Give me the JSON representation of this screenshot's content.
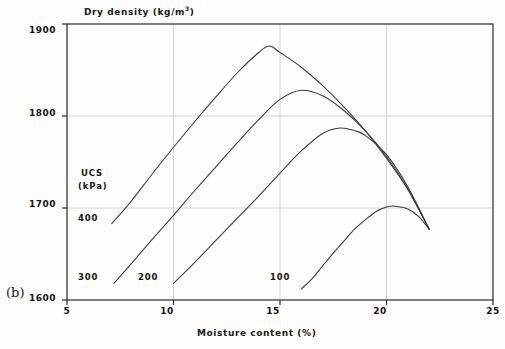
{
  "panel": {
    "label": "(b)"
  },
  "axes": {
    "x": {
      "title": "Moisture content (%)",
      "ticks": [
        5,
        10,
        15,
        20,
        25
      ],
      "min": 5,
      "max": 25
    },
    "y": {
      "title": "Dry density (kg/m",
      "title_sup": "3",
      "title_suffix": ")",
      "title_full": "Dry density (kg/m3)",
      "ticks": [
        1600,
        1700,
        1800,
        1900
      ],
      "min": 1600,
      "max": 1900
    }
  },
  "legend": {
    "line1": "UCS",
    "line2": "(kPa)"
  },
  "curve_labels": {
    "c400": "400",
    "c300": "300",
    "c200": "200",
    "c100": "100"
  },
  "colors": {
    "line": "#3a3a3a",
    "grid": "#c9c9c9",
    "frame": "#2a2a2a",
    "text": "#141414",
    "background": "#fdfdfc"
  },
  "chart_data": {
    "type": "line",
    "title": "",
    "xlabel": "Moisture content (%)",
    "ylabel": "Dry density (kg/m3)",
    "xlim": [
      5,
      25
    ],
    "ylim": [
      1600,
      1900
    ],
    "xticks": [
      5,
      10,
      15,
      20,
      25
    ],
    "yticks": [
      1600,
      1700,
      1800,
      1900
    ],
    "grid": true,
    "legend_position": "inline-labels-left",
    "legend_title": "UCS (kPa)",
    "series": [
      {
        "name": "400",
        "label": "400",
        "peak": {
          "x": 14.5,
          "y": 1876
        },
        "x": [
          7.1,
          8.0,
          9.0,
          10.0,
          11.0,
          12.0,
          13.0,
          14.0,
          14.5,
          15.0,
          16.0,
          17.0,
          18.0,
          19.0,
          20.0,
          21.0,
          22.0
        ],
        "y": [
          1683,
          1707,
          1737,
          1766,
          1794,
          1821,
          1847,
          1869,
          1876,
          1869,
          1853,
          1833,
          1810,
          1784,
          1754,
          1720,
          1677
        ]
      },
      {
        "name": "300",
        "label": "300",
        "peak": {
          "x": 16.0,
          "y": 1828
        },
        "x": [
          7.2,
          8.0,
          9.0,
          10.0,
          11.0,
          12.0,
          13.0,
          14.0,
          15.0,
          16.0,
          17.0,
          18.0,
          19.0,
          20.0,
          21.0,
          22.0
        ],
        "y": [
          1618,
          1639,
          1666,
          1692,
          1719,
          1745,
          1771,
          1796,
          1818,
          1828,
          1822,
          1806,
          1784,
          1756,
          1721,
          1677
        ]
      },
      {
        "name": "200",
        "label": "200",
        "peak": {
          "x": 17.8,
          "y": 1787
        },
        "x": [
          10.0,
          11.0,
          12.0,
          13.0,
          14.0,
          15.0,
          16.0,
          17.0,
          17.8,
          18.5,
          19.0,
          20.0,
          21.0,
          22.0
        ],
        "y": [
          1618,
          1641,
          1665,
          1689,
          1713,
          1738,
          1762,
          1781,
          1787,
          1784,
          1779,
          1758,
          1723,
          1677
        ]
      },
      {
        "name": "100",
        "label": "100",
        "peak": {
          "x": 20.4,
          "y": 1702
        },
        "x": [
          16.0,
          16.5,
          17.0,
          17.5,
          18.0,
          18.5,
          19.0,
          19.5,
          20.0,
          20.4,
          21.0,
          21.5,
          22.0
        ],
        "y": [
          1612,
          1623,
          1637,
          1651,
          1664,
          1677,
          1687,
          1696,
          1701,
          1702,
          1699,
          1691,
          1677
        ]
      }
    ]
  }
}
